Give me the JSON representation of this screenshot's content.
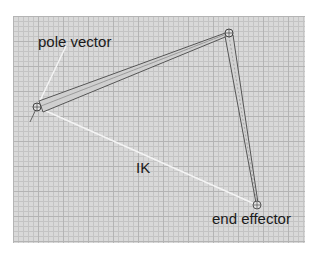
{
  "diagram": {
    "labels": {
      "pole_vector": "pole vector",
      "ik": "IK",
      "end_effector": "end effector"
    },
    "nodes": [
      {
        "id": "root-joint",
        "name": "root joint"
      },
      {
        "id": "mid-joint",
        "name": "middle joint"
      },
      {
        "id": "end-joint",
        "name": "end effector joint"
      }
    ],
    "edges": [
      {
        "from": "root-joint",
        "to": "mid-joint",
        "kind": "bone"
      },
      {
        "from": "mid-joint",
        "to": "end-joint",
        "kind": "bone"
      },
      {
        "from": "root-joint",
        "to": "end-joint",
        "kind": "ik-handle-line"
      },
      {
        "from": "root-joint",
        "to": "pole-vector",
        "kind": "pole-vector-line"
      }
    ],
    "colors": {
      "grid_background": "#d9d9d9",
      "grid_major": "#b4b4b4",
      "grid_minor": "#c4c4c4",
      "bone_outline": "#555555",
      "handle_line": "#ffffff",
      "label_text": "#1a1a1a"
    }
  }
}
